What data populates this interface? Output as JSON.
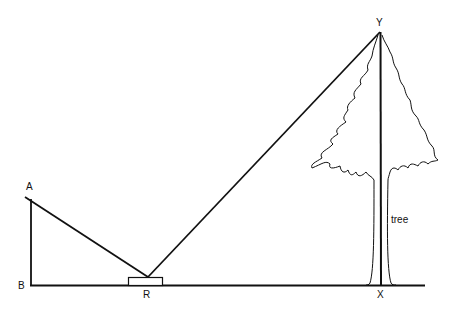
{
  "diagram": {
    "type": "geometry-mirror-tree-height",
    "points": {
      "A": "A",
      "B": "B",
      "R": "R",
      "X": "X",
      "Y": "Y"
    },
    "tree_label": "tree",
    "colors": {
      "line": "#111111",
      "background": "#ffffff"
    }
  }
}
